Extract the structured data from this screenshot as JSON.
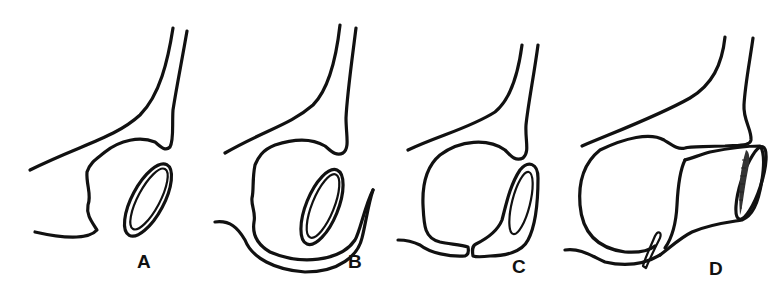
{
  "figure": {
    "stroke_color": "#111111",
    "background": "#ffffff",
    "panels": [
      {
        "id": "A",
        "label": "A",
        "feature": "oval ring beside open body"
      },
      {
        "id": "B",
        "label": "B",
        "feature": "oval ring enclosed by hooked lower fold"
      },
      {
        "id": "C",
        "label": "C",
        "feature": "ring fused to lower body with split base"
      },
      {
        "id": "D",
        "label": "D",
        "feature": "cylindrical tube with shaded open end"
      }
    ]
  }
}
